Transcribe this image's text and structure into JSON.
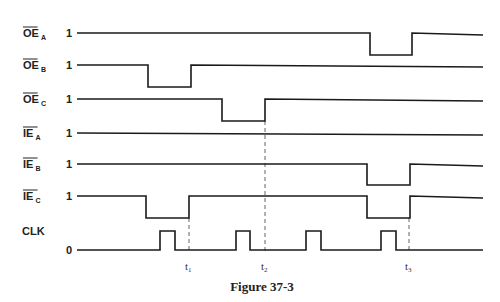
{
  "figure": {
    "caption": "Figure 37-3",
    "signals": [
      {
        "name": "OE",
        "sub": "A",
        "overline": true,
        "level": "1",
        "y_high": 33,
        "y_low": 55,
        "pulses": [
          [
            370,
            412
          ]
        ]
      },
      {
        "name": "OE",
        "sub": "B",
        "overline": true,
        "level": "1",
        "y_high": 65,
        "y_low": 87,
        "pulses": [
          [
            148,
            191
          ]
        ]
      },
      {
        "name": "OE",
        "sub": "C",
        "overline": true,
        "level": "1",
        "y_high": 99,
        "y_low": 121,
        "pulses": [
          [
            222,
            265
          ]
        ]
      },
      {
        "name": "IE",
        "sub": "A",
        "overline": true,
        "level": "1",
        "y_high": 133,
        "y_low": 133,
        "pulses": []
      },
      {
        "name": "IE",
        "sub": "B",
        "overline": true,
        "level": "1",
        "y_high": 164,
        "y_low": 185,
        "pulses": [
          [
            367,
            410
          ]
        ]
      },
      {
        "name": "IE",
        "sub": "C",
        "overline": true,
        "level": "1",
        "y_high": 196,
        "y_low": 218,
        "pulses": [
          [
            146,
            189
          ],
          [
            367,
            410
          ]
        ]
      },
      {
        "name": "CLK",
        "sub": "",
        "overline": false,
        "level": "0",
        "y_high": 231,
        "y_low": 250,
        "clock": true,
        "pulses": [
          [
            160,
            175
          ],
          [
            236,
            250
          ],
          [
            306,
            321
          ],
          [
            381,
            396
          ]
        ]
      }
    ],
    "time_markers": [
      {
        "label": "t",
        "sub": "1",
        "x": 189
      },
      {
        "label": "t",
        "sub": "2",
        "x": 265
      },
      {
        "label": "t",
        "sub": "3",
        "x": 409
      }
    ],
    "x_start": 77,
    "x_end": 483
  }
}
